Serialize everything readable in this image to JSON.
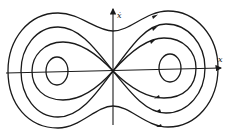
{
  "diagram": {
    "type": "phase-portrait",
    "axes": {
      "x_label": "x",
      "y_label": "ẋ"
    },
    "fixed_points": [
      {
        "kind": "center",
        "position": "left"
      },
      {
        "kind": "saddle",
        "position": "origin"
      },
      {
        "kind": "center",
        "position": "right"
      }
    ],
    "orbits": [
      {
        "name": "left-inner-orbit"
      },
      {
        "name": "right-inner-orbit"
      },
      {
        "name": "homoclinic-left"
      },
      {
        "name": "homoclinic-right"
      },
      {
        "name": "left-ring"
      },
      {
        "name": "right-ring"
      },
      {
        "name": "outer-orbit"
      }
    ],
    "colors": {
      "stroke": "#1a1a1a",
      "background": "#ffffff"
    }
  }
}
